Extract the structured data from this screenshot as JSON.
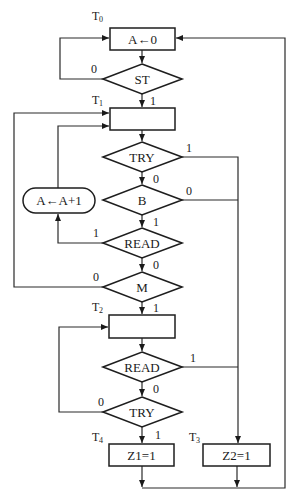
{
  "diagram": {
    "type": "ASM flowchart",
    "states": [
      {
        "id": "T0",
        "label": "T",
        "sub": "0"
      },
      {
        "id": "T1",
        "label": "T",
        "sub": "1"
      },
      {
        "id": "T2",
        "label": "T",
        "sub": "2"
      },
      {
        "id": "T3",
        "label": "T",
        "sub": "3"
      },
      {
        "id": "T4",
        "label": "T",
        "sub": "4"
      }
    ],
    "boxes": {
      "t0": "A←0",
      "t1": "",
      "t2": "",
      "z1": "Z1=1",
      "z2": "Z2=1",
      "incr": "A←A+1"
    },
    "decisions": {
      "st": "ST",
      "try1": "TRY",
      "b": "B",
      "read1": "READ",
      "m": "M",
      "read2": "READ",
      "try2": "TRY"
    },
    "edge_labels": {
      "st_0": "0",
      "st_1": "1",
      "try1_1": "1",
      "try1_0": "0",
      "b_0_right": "0",
      "b_1": "1",
      "read1_1": "1",
      "read1_0": "0",
      "m_0": "0",
      "m_1": "1",
      "read2_1": "1",
      "read2_0": "0",
      "try2_0": "0",
      "try2_1": "1"
    },
    "colors": {
      "line": "#1e1e1e",
      "background": "#ffffff"
    }
  }
}
